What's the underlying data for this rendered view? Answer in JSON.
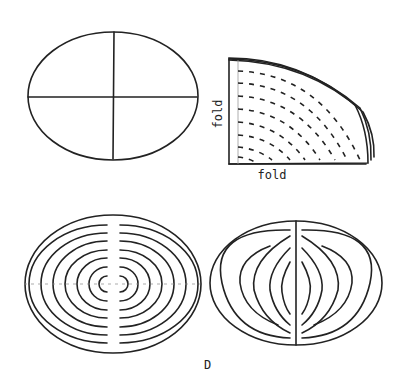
{
  "figure": {
    "panels": [
      {
        "id": "oval-with-folds",
        "description": "Oval divided into quarters by two crossing fold lines"
      },
      {
        "id": "folded-quarter",
        "description": "Quarter-folded oval with dashed concentric cut lines",
        "labels": {
          "vertical": "fold",
          "horizontal": "fold"
        }
      },
      {
        "id": "concentric-cut-oval",
        "description": "Unfolded oval with concentric cut rings and a central uncut strip"
      },
      {
        "id": "lens-cut-oval",
        "description": "Oval with nested lens-shaped cut rings joined at a central vertical strip"
      }
    ],
    "caption": "D"
  }
}
